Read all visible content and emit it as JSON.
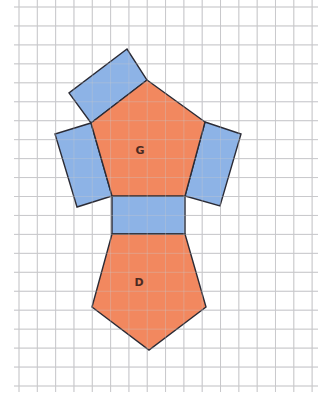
{
  "diagram": {
    "type": "net",
    "colors": {
      "pentagon_fill": "#F2885F",
      "rectangle_fill": "#8DB3E6",
      "outline": "#2b2b35",
      "grid": "#c9c9cc",
      "background": "#ffffff"
    },
    "grid": {
      "x_start": 19,
      "x_step": 18.32,
      "x_count": 17,
      "y_start": 7,
      "y_step": 18.95,
      "y_count": 21,
      "x_extent": [
        14,
        318
      ],
      "y_extent": [
        0,
        392
      ]
    },
    "labels": {
      "top_pentagon": "G",
      "bottom_pentagon": "D"
    },
    "faces": [
      {
        "name": "pentagon-g",
        "kind": "pentagon",
        "label": "G",
        "points": "147,80 205,122 185,196 112,196 91,123",
        "label_pos": [
          140,
          154
        ]
      },
      {
        "name": "pentagon-d",
        "kind": "pentagon",
        "label": "D",
        "points": "112,234 185,234 206,307 149,350 92,307",
        "label_pos": [
          139,
          286
        ]
      },
      {
        "name": "rect-top",
        "kind": "rectangle",
        "points": "91,123 147,80 127,49 69,93"
      },
      {
        "name": "rect-left",
        "kind": "rectangle",
        "points": "91,123 112,196 77,207 55,134"
      },
      {
        "name": "rect-right",
        "kind": "rectangle",
        "points": "205,122 241,134 220,206 185,196"
      },
      {
        "name": "rect-middle",
        "kind": "rectangle",
        "points": "112,196 185,196 185,234 112,234"
      }
    ]
  }
}
